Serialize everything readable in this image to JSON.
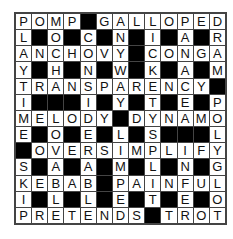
{
  "puzzle": {
    "rows": 13,
    "cols": 13,
    "block_char": "#",
    "grid": [
      "POMP#GALLOPED",
      "L#O#C#N#I#A#R",
      "ANCHOVY#CONGA",
      "Y#H#N#W#K#A#M",
      "TRANSPARENCY#",
      "I###I#Y#T#E#P",
      "MELODY#DYNAMO",
      "E#O#E#L#S###L",
      "#OVERSIMPLIFY",
      "S#A#A#M#L#N#G",
      "KEBAB#PAINFUL",
      "I#L#L#E#T#E#O",
      "PRETENDS#TROT"
    ]
  },
  "colors": {
    "block": "#000000",
    "cell": "#ffffff",
    "border": "#444444",
    "letter": "#111111"
  }
}
